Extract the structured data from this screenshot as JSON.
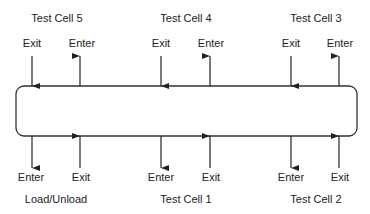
{
  "diagram": {
    "top_cells": [
      {
        "label": "Test Cell 5",
        "x": 57,
        "ports": [
          {
            "label": "Exit",
            "x": 32,
            "dir": "down"
          },
          {
            "label": "Enter",
            "x": 80,
            "dir": "up"
          }
        ]
      },
      {
        "label": "Test Cell 4",
        "x": 186,
        "ports": [
          {
            "label": "Exit",
            "x": 161,
            "dir": "down"
          },
          {
            "label": "Enter",
            "x": 210,
            "dir": "up"
          }
        ]
      },
      {
        "label": "Test Cell 3",
        "x": 316,
        "ports": [
          {
            "label": "Exit",
            "x": 291,
            "dir": "down"
          },
          {
            "label": "Enter",
            "x": 339,
            "dir": "up"
          }
        ]
      }
    ],
    "bottom_cells": [
      {
        "label": "Load/Unload",
        "x": 56,
        "ports": [
          {
            "label": "Enter",
            "x": 32,
            "dir": "down"
          },
          {
            "label": "Exit",
            "x": 80,
            "dir": "up"
          }
        ]
      },
      {
        "label": "Test Cell 1",
        "x": 186,
        "ports": [
          {
            "label": "Enter",
            "x": 161,
            "dir": "down"
          },
          {
            "label": "Exit",
            "x": 210,
            "dir": "up"
          }
        ]
      },
      {
        "label": "Test Cell 2",
        "x": 316,
        "ports": [
          {
            "label": "Enter",
            "x": 291,
            "dir": "down"
          },
          {
            "label": "Exit",
            "x": 339,
            "dir": "up"
          }
        ]
      }
    ],
    "conveyor_box": {
      "x": 16,
      "y": 86,
      "width": 341,
      "height": 50,
      "radius": 8
    },
    "colors": {
      "line": "#222222",
      "text": "#222222",
      "background": "#ffffff"
    }
  }
}
